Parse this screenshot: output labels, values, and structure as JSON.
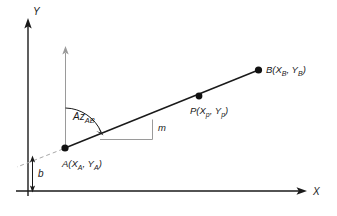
{
  "figure": {
    "background_color": "#ffffff",
    "stroke_color": "#1a1a1a",
    "helper_color": "#9a9a9a",
    "dashed_color": "#a8a8a8"
  },
  "axes": {
    "y_label": "Y",
    "x_label": "X",
    "origin": {
      "x": 28,
      "y": 191
    }
  },
  "points": [
    {
      "id": "A",
      "label_main": "A(X",
      "sub1": "A",
      "mid": ", Y",
      "sub2": "A",
      "tail": ")",
      "x": 65,
      "y": 148
    },
    {
      "id": "P",
      "label_main": "P(X",
      "sub1": "p",
      "mid": ", Y",
      "sub2": "p",
      "tail": ")",
      "x": 199,
      "y": 96
    },
    {
      "id": "B",
      "label_main": "B(X",
      "sub1": "B",
      "mid": ", Y",
      "sub2": "B",
      "tail": ")",
      "x": 258,
      "y": 70
    }
  ],
  "annotations": {
    "azimuth_main": "Az",
    "azimuth_sub": "AB",
    "slope_label": "m",
    "intercept_label": "b"
  }
}
